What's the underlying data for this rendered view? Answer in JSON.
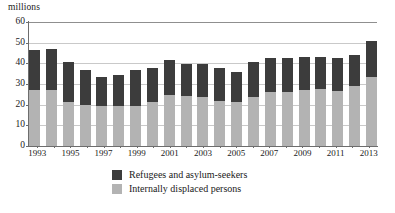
{
  "chart_data": {
    "type": "bar",
    "subtype": "stacked-vertical",
    "title": "",
    "subtitle": "",
    "unit_caption": "millions",
    "xlabel": "",
    "ylabel": "",
    "ylim": [
      0,
      60
    ],
    "ytick_step": 10,
    "yticks": [
      0,
      10,
      20,
      30,
      40,
      50,
      60
    ],
    "ytick_labels": [
      "0",
      "10",
      "20",
      "30",
      "40",
      "50",
      "60"
    ],
    "grid": "horizontal",
    "legend_position": "bottom-center",
    "categories": [
      "1993",
      "1994",
      "1995",
      "1996",
      "1997",
      "1998",
      "1999",
      "2000",
      "2001",
      "2002",
      "2003",
      "2004",
      "2005",
      "2006",
      "2007",
      "2008",
      "2009",
      "2010",
      "2011",
      "2012",
      "2013"
    ],
    "xtick_labels_shown": [
      "1993",
      "1995",
      "1997",
      "1999",
      "2001",
      "2003",
      "2005",
      "2007",
      "2009",
      "2011",
      "2013"
    ],
    "series": [
      {
        "name": "Internally displaced persons",
        "color": "#b3b3b3",
        "values": [
          27.0,
          27.2,
          21.5,
          19.8,
          19.2,
          19.3,
          19.4,
          21.2,
          24.8,
          24.4,
          23.5,
          22.0,
          21.1,
          23.9,
          26.2,
          26.3,
          27.1,
          27.5,
          26.6,
          28.8,
          33.3
        ]
      },
      {
        "name": "Refugees and asylum-seekers",
        "color": "#3c3c3c",
        "values": [
          19.5,
          19.6,
          19.0,
          17.0,
          14.0,
          15.3,
          17.3,
          16.5,
          16.8,
          15.5,
          16.4,
          15.8,
          14.6,
          16.9,
          16.3,
          16.2,
          16.1,
          15.5,
          16.0,
          15.1,
          17.5
        ]
      }
    ],
    "totals": [
      46.5,
      46.8,
      40.5,
      36.8,
      33.2,
      34.6,
      36.7,
      37.7,
      41.6,
      39.9,
      39.9,
      37.8,
      35.7,
      40.8,
      42.5,
      42.5,
      43.2,
      43.0,
      42.6,
      43.9,
      50.8
    ]
  },
  "legend": {
    "items": [
      {
        "label": "Refugees and asylum-seekers",
        "swatch": "dark"
      },
      {
        "label": "Internally displaced persons",
        "swatch": "light"
      }
    ]
  }
}
